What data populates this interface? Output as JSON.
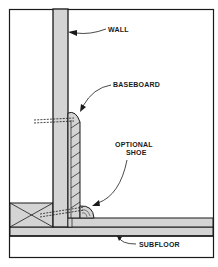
{
  "diagram": {
    "type": "cross-section",
    "labels": {
      "wall": "WALL",
      "baseboard": "BASEBOARD",
      "shoe_line1": "OPTIONAL",
      "shoe_line2": "SHOE",
      "subfloor": "SUBFLOOR"
    },
    "colors": {
      "line": "#1a1a1a",
      "fill_gray": "#d4d4d4",
      "background": "#ffffff"
    }
  }
}
